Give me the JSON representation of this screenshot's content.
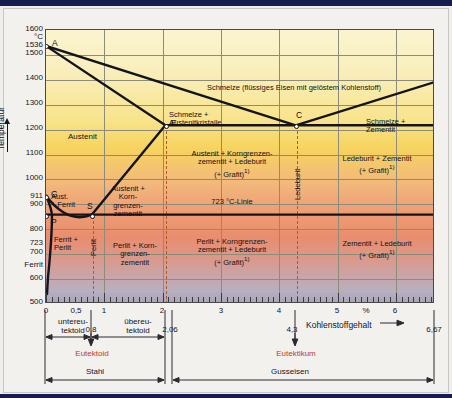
{
  "chart_data": {
    "type": "line",
    "xlabel": "Kohlenstoffgehalt",
    "xunit": "%",
    "ylabel": "Temperatur",
    "yunit": "°C",
    "xlim": [
      0,
      6.67
    ],
    "ylim": [
      500,
      1600
    ],
    "grid": true,
    "x_ticks": [
      "0",
      "0,5",
      "1",
      "2",
      "3",
      "4",
      "5",
      "6"
    ],
    "x_tick_values": [
      0,
      0.5,
      1,
      2,
      3,
      4,
      5,
      6
    ],
    "y_ticks": [
      "1600",
      "1536",
      "1500",
      "1400",
      "1300",
      "1200",
      "1100",
      "1000",
      "911",
      "900",
      "800",
      "723",
      "700",
      "600",
      "500"
    ],
    "y_tick_values": [
      1600,
      1536,
      1500,
      1400,
      1300,
      1200,
      1100,
      1000,
      911,
      900,
      800,
      723,
      700,
      600,
      500
    ],
    "points": [
      {
        "id": "A",
        "x": 0,
        "y": 1536
      },
      {
        "id": "D",
        "x": 6.67,
        "y": 1320
      },
      {
        "id": "E",
        "x": 2.06,
        "y": 1147
      },
      {
        "id": "C",
        "x": 4.3,
        "y": 1147
      },
      {
        "id": "F",
        "x": 6.67,
        "y": 1147
      },
      {
        "id": "G",
        "x": 0,
        "y": 911
      },
      {
        "id": "S",
        "x": 0.8,
        "y": 723
      },
      {
        "id": "P",
        "x": 0,
        "y": 723
      },
      {
        "id": "K",
        "x": 6.67,
        "y": 723
      }
    ],
    "series": [
      {
        "name": "Liquidus A-E",
        "points": [
          [
            0,
            1536
          ],
          [
            2.06,
            1147
          ]
        ]
      },
      {
        "name": "Liquidus A-C",
        "points": [
          [
            0,
            1536
          ],
          [
            4.3,
            1147
          ]
        ]
      },
      {
        "name": "Liquidus C-D",
        "points": [
          [
            4.3,
            1147
          ],
          [
            6.67,
            1320
          ]
        ]
      },
      {
        "name": "Solidus E-C-F (1147 °C)",
        "points": [
          [
            2.06,
            1147
          ],
          [
            6.67,
            1147
          ]
        ]
      },
      {
        "name": "G-S (A3)",
        "points": [
          [
            0,
            911
          ],
          [
            0.8,
            723
          ]
        ]
      },
      {
        "name": "S-E (Acm)",
        "points": [
          [
            0.8,
            723
          ],
          [
            2.06,
            1147
          ]
        ]
      },
      {
        "name": "P-S-K (723 °C-Linie)",
        "points": [
          [
            0,
            723
          ],
          [
            6.67,
            723
          ]
        ]
      },
      {
        "name": "Ferrit-Grenze",
        "points": [
          [
            0,
            911
          ],
          [
            0.02,
            723
          ],
          [
            0,
            500
          ]
        ]
      }
    ]
  },
  "axes": {
    "y_title": "Temperatur",
    "y_unit": "°C",
    "y_labels": [
      "1600",
      "1536",
      "1500",
      "1400",
      "1300",
      "1200",
      "1100",
      "1000",
      "911",
      "900",
      "800",
      "723",
      "700",
      "600",
      "500"
    ],
    "y_ferrit_label": "Ferrit",
    "x_title": "Kohlenstoffgehalt",
    "x_percent": "%",
    "x_labels": [
      "0",
      "0,5",
      "1",
      "2",
      "3",
      "4",
      "5",
      "6"
    ],
    "x_end_label": "6,67"
  },
  "regions": {
    "schmelze": "Schmelze (flüssiges Eisen mit gelöstem Kohlenstoff)",
    "schmelze_austenit": "Schmelze +\nAustenitkristalle",
    "schmelze_zementit": "Schmelze +\nZementit",
    "austenit": "Austenit",
    "austenit_korn": "Austenit +\nKorn-\ngrenzen-\nzementit",
    "aust_ferrit": "Aust.\n+ Ferrit",
    "ferrit_perlit": "Ferrit +\nPerlit",
    "perlit": "Perlit",
    "ledeburit": "Ledeburit",
    "austenit_korn_ledeburit": "Austenit + Korngrenzen-\nzementit + Ledeburit\n(+ Grafit)",
    "perlit_korn_zementit": "Perlit + Korn-\ngrenzen-\nzementit",
    "perlit_korn_ledeburit": "Perlit + Korngrenzen-\nzementit + Ledeburit\n(+ Grafit)",
    "ledeburit_zementit": "Ledeburit + Zementit\n(+ Grafit)",
    "zementit_ledeburit": "Zementit + Ledeburit\n(+ Grafit)",
    "linie723": "723 °C-Linie",
    "footnote_marker": "1)"
  },
  "points": {
    "A": "A",
    "B": "B",
    "C": "C",
    "D": "D",
    "E": "E",
    "F": "F",
    "G": "G",
    "K": "K",
    "P": "P",
    "S": "S"
  },
  "annotations": {
    "untereutektoid": "untereu-\ntektoid",
    "uebereutektoid": "übereu-\ntektoid",
    "val_08": "0,8",
    "val_206": "2,06",
    "val_43": "4,3",
    "val_667": "6,67",
    "eutektoid": "Eutektoid",
    "eutektikum": "Eutektikum",
    "stahl": "Stahl",
    "gusseisen": "Gusseisen"
  },
  "colors": {
    "accent_red": "#c23b22",
    "line": "#14141e",
    "grid": "#8d8b7a",
    "topbar": "#161d4e",
    "melt_top": "#fbf4cf",
    "gold": "#f6d45f",
    "orange": "#ee9f75",
    "gray_bottom": "#a9a4b8"
  }
}
